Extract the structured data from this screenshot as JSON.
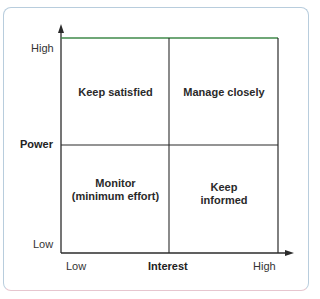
{
  "diagram": {
    "type": "2x2 matrix",
    "y_axis": {
      "title": "Power",
      "high_label": "High",
      "low_label": "Low"
    },
    "x_axis": {
      "title": "Interest",
      "low_label": "Low",
      "high_label": "High"
    },
    "quadrants": {
      "top_left": "Keep satisfied",
      "top_right": "Manage closely",
      "bottom_left_line1": "Monitor",
      "bottom_left_line2": "(minimum effort)",
      "bottom_right_line1": "Keep",
      "bottom_right_line2": "informed"
    },
    "colors": {
      "grid": "#2b2b2b",
      "top_edge": "#3f8a4a",
      "frame": "#b8cddd"
    }
  }
}
